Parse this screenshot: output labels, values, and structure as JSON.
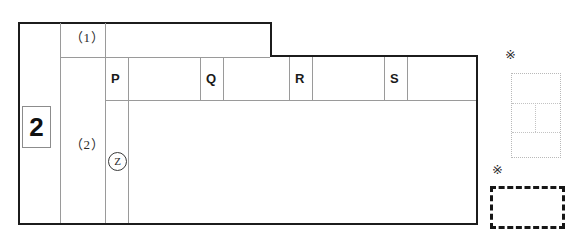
{
  "sheet": {
    "title": "answer-grid-worksheet",
    "question_number": "2",
    "sub_items": [
      {
        "id": "sub-1",
        "label": "（1）"
      },
      {
        "id": "sub-2",
        "label": "（2）"
      }
    ],
    "circled_marker": "Z",
    "answer_cells": [
      {
        "id": "cell-p",
        "label": "P"
      },
      {
        "id": "cell-q",
        "label": "Q"
      },
      {
        "id": "cell-r",
        "label": "R"
      },
      {
        "id": "cell-s",
        "label": "S"
      }
    ]
  },
  "annotations": [
    {
      "id": "annotation-1",
      "mark": "※",
      "box_style": "dotted-light",
      "has_inner_divisions": true
    },
    {
      "id": "annotation-2",
      "mark": "※",
      "box_style": "dashed-bold",
      "has_inner_divisions": false
    }
  ],
  "colors": {
    "ink_heavy": "#1c1c1c",
    "ink_light": "#9a9a9a",
    "dotted_light": "#b9b9b9",
    "dashed_bold": "#161616",
    "paper": "#ffffff"
  }
}
